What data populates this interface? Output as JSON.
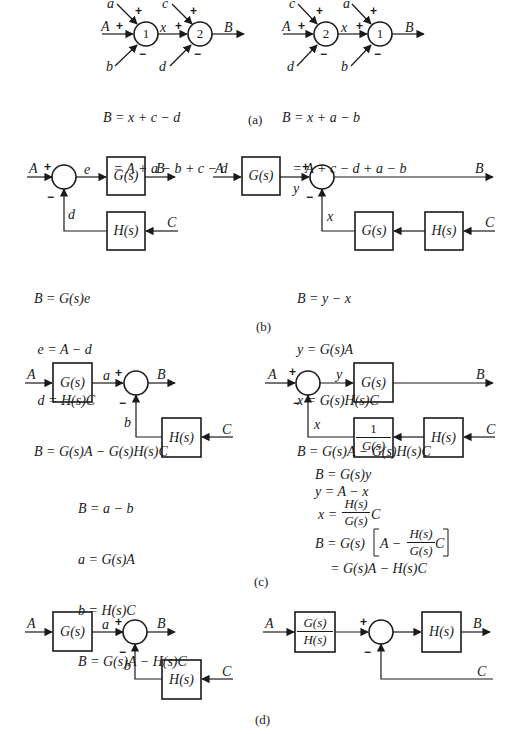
{
  "figure": {
    "panel_a": {
      "caption": "(a)",
      "left": {
        "inputs": {
          "A": "A",
          "a": "a",
          "b": "b",
          "c": "c",
          "d": "d"
        },
        "intermediate": "x",
        "output": "B",
        "junctions": [
          "1",
          "2"
        ],
        "signs": {
          "plus": "+",
          "minus": "−"
        },
        "equations": [
          "B = x + c − d",
          "   = A + a − b + c − d"
        ]
      },
      "right": {
        "inputs": {
          "A": "A",
          "a": "a",
          "b": "b",
          "c": "c",
          "d": "d"
        },
        "intermediate": "x",
        "output": "B",
        "junctions": [
          "2",
          "1"
        ],
        "signs": {
          "plus": "+",
          "minus": "−"
        },
        "equations": [
          "B = x + a − b",
          "   = A + c − d + a − b"
        ]
      }
    },
    "panel_b": {
      "caption": "(b)",
      "left": {
        "labels": {
          "A": "A",
          "e": "e",
          "B": "B",
          "d": "d",
          "C": "C"
        },
        "blocks": {
          "forward": "G(s)",
          "feedback": "H(s)"
        },
        "equations": [
          "B = G(s)e",
          " e = A − d",
          " d = H(s)C",
          "B = G(s)A − G(s)H(s)C"
        ]
      },
      "right": {
        "labels": {
          "A": "A",
          "y": "y",
          "B": "B",
          "x": "x",
          "C": "C"
        },
        "blocks": {
          "forward": "G(s)",
          "feedback1": "G(s)",
          "feedback2": "H(s)"
        },
        "equations": [
          "B = y − x",
          "y = G(s)A",
          "x = G(s)H(s)C",
          "B = G(s)A − G(s)H(s)C"
        ]
      }
    },
    "panel_c": {
      "caption": "(c)",
      "left": {
        "labels": {
          "A": "A",
          "a": "a",
          "B": "B",
          "b": "b",
          "C": "C"
        },
        "blocks": {
          "forward": "G(s)",
          "feedback": "H(s)"
        },
        "equations": [
          "B = a − b",
          "a = G(s)A",
          "b = H(s)C",
          "B = G(s)A − H(s)C"
        ]
      },
      "right": {
        "labels": {
          "A": "A",
          "y": "y",
          "B": "B",
          "x": "x",
          "C": "C"
        },
        "blocks": {
          "forward": "G(s)",
          "feedback1_num": "1",
          "feedback1_den": "G(s)",
          "feedback2": "H(s)"
        },
        "equations": {
          "line1": "B = G(s)y",
          "line2": "y = A − x",
          "line3_lhs": "x =",
          "line3_num": "H(s)",
          "line3_den": "G(s)",
          "line3_rhs": "C",
          "line4_lhs": "B = G(s)",
          "line4_inner_a": "A −",
          "line4_num": "H(s)",
          "line4_den": "G(s)",
          "line4_inner_c": "C",
          "line5": "= G(s)A − H(s)C"
        }
      }
    },
    "panel_d": {
      "caption": "(d)",
      "left": {
        "labels": {
          "A": "A",
          "a": "a",
          "B": "B",
          "b": "b",
          "C": "C"
        },
        "blocks": {
          "forward": "G(s)",
          "feedback": "H(s)"
        }
      },
      "right": {
        "labels": {
          "A": "A",
          "B": "B",
          "C": "C"
        },
        "blocks": {
          "prefilter_num": "G(s)",
          "prefilter_den": "H(s)",
          "forward": "H(s)"
        }
      }
    }
  }
}
